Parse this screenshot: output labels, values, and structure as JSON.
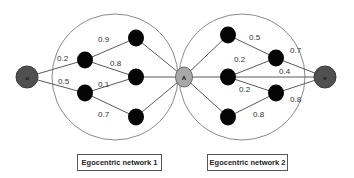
{
  "diagram": {
    "type": "two overlapping egocentric networks",
    "nodes": {
      "u": {
        "label": "u",
        "role": "source"
      },
      "A": {
        "label": "A",
        "role": "ego / bridge"
      },
      "v": {
        "label": "v",
        "role": "target"
      }
    },
    "networks": [
      {
        "caption": "Egocentric network 1",
        "edges": [
          {
            "from": "u",
            "to": "L1",
            "weight": "0.2"
          },
          {
            "from": "u",
            "to": "L2",
            "weight": "0.5"
          },
          {
            "from": "L1",
            "to": "L3",
            "weight": "0.9"
          },
          {
            "from": "L1",
            "to": "L4",
            "weight": "0.8"
          },
          {
            "from": "L2",
            "to": "L4",
            "weight": "0.1"
          },
          {
            "from": "L2",
            "to": "L5",
            "weight": "0.7"
          },
          {
            "from": "L3",
            "to": "A",
            "weight": ""
          },
          {
            "from": "L4",
            "to": "A",
            "weight": ""
          },
          {
            "from": "L5",
            "to": "A",
            "weight": ""
          }
        ]
      },
      {
        "caption": "Egocentric network  2",
        "edges": [
          {
            "from": "A",
            "to": "R1",
            "weight": ""
          },
          {
            "from": "A",
            "to": "R2",
            "weight": ""
          },
          {
            "from": "A",
            "to": "R3",
            "weight": ""
          },
          {
            "from": "R1",
            "to": "R4",
            "weight": "0.5"
          },
          {
            "from": "R2",
            "to": "R4",
            "weight": "0.2"
          },
          {
            "from": "R2",
            "to": "R5",
            "weight": "0.2"
          },
          {
            "from": "R2",
            "to": "v",
            "weight": "0.4"
          },
          {
            "from": "R4",
            "to": "v",
            "weight": "0.7"
          },
          {
            "from": "R3",
            "to": "R5",
            "weight": "0.8"
          },
          {
            "from": "R5",
            "to": "v",
            "weight": "0.8"
          }
        ]
      }
    ],
    "weights": {
      "u_L1": "0.2",
      "u_L2": "0.5",
      "L1_L3": "0.9",
      "L1_L4": "0.8",
      "L2_L4": "0.1",
      "L2_L5": "0.7",
      "R1_R4": "0.5",
      "R2_R4": "0.2",
      "R2_R5": "0.2",
      "R2_v": "0.4",
      "R4_v": "0.7",
      "R3_R5": "0.8",
      "R5_v": "0.8"
    },
    "captions": {
      "network1": "Egocentric network 1",
      "network2": "Egocentric network  2"
    },
    "colors": {
      "intermediate_node": "#050505",
      "ego_node": "#a8a8a8",
      "endpoint_node": "#505050",
      "edge": "#5a5a5a",
      "circle": "#8a8a8a"
    }
  }
}
